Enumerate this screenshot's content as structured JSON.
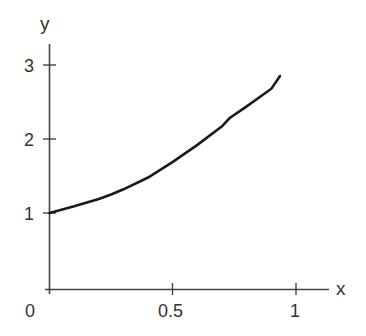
{
  "chart_data": {
    "type": "line",
    "title": "",
    "xlabel": "x",
    "ylabel": "y",
    "xlim": [
      0,
      1.13
    ],
    "ylim": [
      0,
      3.3
    ],
    "grid": false,
    "legend": null,
    "x_ticks": [
      0,
      0.5,
      1
    ],
    "x_tick_labels": [
      "0",
      "0.5",
      "1"
    ],
    "y_ticks": [
      1,
      2,
      3
    ],
    "y_tick_labels": [
      "1",
      "2",
      "3"
    ],
    "origin_label": "0",
    "series": [
      {
        "name": "curve",
        "color": "#1a1a1a",
        "x": [
          0,
          0.1,
          0.2,
          0.25,
          0.3,
          0.4,
          0.5,
          0.6,
          0.7,
          0.73,
          0.8,
          0.9,
          0.935
        ],
        "values": [
          1.0,
          1.09,
          1.19,
          1.25,
          1.32,
          1.48,
          1.69,
          1.92,
          2.17,
          2.28,
          2.44,
          2.68,
          2.85
        ]
      }
    ]
  },
  "labels": {
    "x_axis": "x",
    "y_axis": "y",
    "origin": "0",
    "x_tick_05": "0.5",
    "x_tick_1": "1",
    "y_tick_1": "1",
    "y_tick_2": "2",
    "y_tick_3": "3"
  }
}
